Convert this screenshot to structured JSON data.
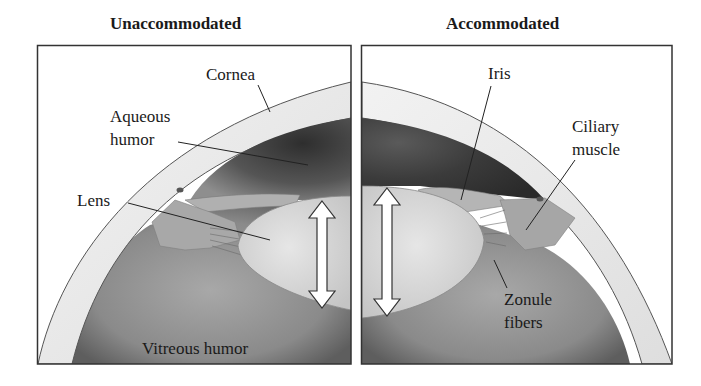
{
  "figure": {
    "panels": [
      {
        "id": "left",
        "title": "Unaccommodated",
        "labels": {
          "cornea": "Cornea",
          "aqueous_1": "Aqueous",
          "aqueous_2": "humor",
          "lens": "Lens",
          "vitreous": "Vitreous humor"
        }
      },
      {
        "id": "right",
        "title": "Accommodated",
        "labels": {
          "iris": "Iris",
          "ciliary_1": "Ciliary",
          "ciliary_2": "muscle",
          "zonule_1": "Zonule",
          "zonule_2": "fibers"
        }
      }
    ],
    "arrows": {
      "left_lens_thickness": "double-headed-arrow",
      "right_lens_thickness": "double-headed-arrow"
    },
    "colors": {
      "cornea_fill": "#ececec",
      "aqueous_dark": "#3a3a3a",
      "aqueous_light": "#9a9a9a",
      "lens_fill": "#d9d9d9",
      "vitreous_fill": "#8c8c8c",
      "iris_fill": "#b8b8b8",
      "ciliary_fill": "#a9a9a9",
      "frame": "#333333"
    }
  }
}
